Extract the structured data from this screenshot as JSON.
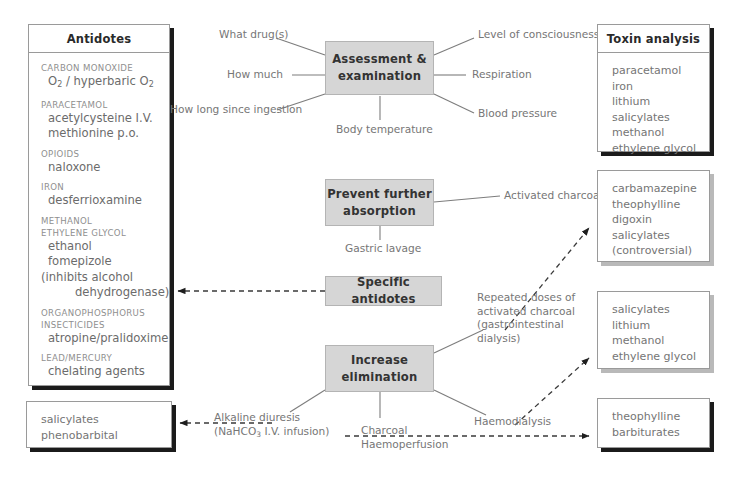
{
  "diagram": {
    "colors": {
      "process_fill": "#d6d6d6",
      "process_border": "#b4b4b4",
      "panel_border": "#9a9a9a",
      "shadow_strong": "#1b1b1b",
      "shadow_soft": "#b9b9b9",
      "text": "#6c6c6c",
      "heading_text": "#2a2a2a"
    }
  },
  "antidotes_panel": {
    "title": "Antidotes",
    "groups": [
      {
        "category": "CARBON MONOXIDE",
        "drugs": [
          {
            "text": "O2 / hyperbaric O2",
            "indent": "normal"
          }
        ]
      },
      {
        "category": "PARACETAMOL",
        "drugs": [
          {
            "text": "acetylcysteine I.V.",
            "indent": "normal"
          },
          {
            "text": "methionine p.o.",
            "indent": "normal"
          }
        ]
      },
      {
        "category": "OPIOIDS",
        "drugs": [
          {
            "text": "naloxone",
            "indent": "normal"
          }
        ]
      },
      {
        "category": "IRON",
        "drugs": [
          {
            "text": "desferrioxamine",
            "indent": "normal"
          }
        ]
      },
      {
        "category": "METHANOL",
        "category2": "ETHYLENE GLYCOL",
        "drugs": [
          {
            "text": "ethanol",
            "indent": "normal"
          },
          {
            "text": "fomepizole",
            "indent": "normal"
          },
          {
            "text": "(inhibits alcohol",
            "indent": "none"
          },
          {
            "text": "dehydrogenase)",
            "indent": "deep"
          }
        ]
      },
      {
        "category": "ORGANOPHOSPHORUS",
        "category2": "INSECTICIDES",
        "drugs": [
          {
            "text": "atropine/pralidoxime",
            "indent": "normal"
          }
        ]
      },
      {
        "category": "LEAD/MERCURY",
        "drugs": [
          {
            "text": "chelating agents",
            "indent": "normal"
          }
        ]
      }
    ]
  },
  "process_boxes": [
    {
      "id": "assessment",
      "label": "Assessment &\nexamination"
    },
    {
      "id": "prevent",
      "label": "Prevent further\nabsorption"
    },
    {
      "id": "antidotes",
      "label": "Specific antidotes"
    },
    {
      "id": "elimination",
      "label": "Increase\nelimination"
    }
  ],
  "assessment_notes": {
    "left": [
      "What drug(s)",
      "How much",
      "How long since ingestion"
    ],
    "right": [
      "Level of consciousness",
      "Respiration",
      "Blood pressure"
    ],
    "bottom": "Body temperature"
  },
  "prevent_notes": {
    "right": "Activated charcoal",
    "bottom": "Gastric lavage"
  },
  "elimination_notes": {
    "repeated_charcoal": [
      "Repeated doses of",
      "activated charcoal",
      "(gastrointestinal",
      "dialysis)"
    ],
    "alkaline_diuresis": [
      "Alkaline diuresis",
      "(NaHCO3 I.V. infusion)"
    ],
    "charcoal_haemoperfusion": [
      "Charcoal",
      "Haemoperfusion"
    ],
    "haemodialysis": "Haemodialysis"
  },
  "toxin_analysis_panel": {
    "title": "Toxin analysis",
    "items": [
      "paracetamol",
      "iron",
      "lithium",
      "salicylates",
      "methanol",
      "ethylene glycol"
    ]
  },
  "charcoal_indications_panel": {
    "items": [
      "carbamazepine",
      "theophylline",
      "digoxin",
      "salicylates",
      "(controversial)"
    ]
  },
  "haemodialysis_panel": {
    "items": [
      "salicylates",
      "lithium",
      "methanol",
      "ethylene glycol"
    ]
  },
  "haemoperfusion_panel": {
    "items": [
      "theophylline",
      "barbiturates"
    ]
  },
  "alkaline_diuresis_panel": {
    "items": [
      "salicylates",
      "phenobarbital"
    ]
  }
}
